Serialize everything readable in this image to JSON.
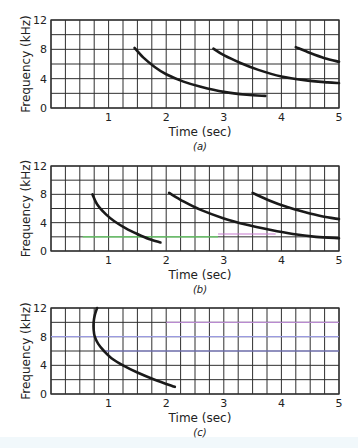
{
  "figure": {
    "panels": [
      "a",
      "b",
      "c"
    ],
    "grid_color": "#2f2f2f",
    "curve_color": "#1a1a1a",
    "background": "#ffffff"
  },
  "chart_data": [
    {
      "type": "line",
      "panel_label": "(a)",
      "xlabel": "Time (sec)",
      "ylabel": "Frequency (kHz)",
      "xlim": [
        0,
        5
      ],
      "ylim": [
        0,
        12
      ],
      "x_ticks": [
        "0",
        "1",
        "2",
        "3",
        "4",
        "5"
      ],
      "y_ticks": [
        "0",
        "4",
        "8",
        "12"
      ],
      "grid": {
        "x_step": 0.25,
        "y_step": 2
      },
      "tinted_gridlines": [],
      "series": [
        {
          "name": "glide 1",
          "points": [
            [
              1.45,
              8.2
            ],
            [
              1.6,
              6.9
            ],
            [
              1.8,
              5.6
            ],
            [
              2.0,
              4.6
            ],
            [
              2.3,
              3.6
            ],
            [
              2.6,
              2.9
            ],
            [
              3.0,
              2.2
            ],
            [
              3.4,
              1.8
            ],
            [
              3.72,
              1.65
            ]
          ]
        },
        {
          "name": "glide 2",
          "points": [
            [
              2.82,
              8.1
            ],
            [
              3.0,
              7.2
            ],
            [
              3.3,
              6.1
            ],
            [
              3.6,
              5.2
            ],
            [
              4.0,
              4.3
            ],
            [
              4.4,
              3.8
            ],
            [
              4.8,
              3.5
            ],
            [
              5.0,
              3.4
            ]
          ]
        },
        {
          "name": "glide 3",
          "points": [
            [
              4.25,
              8.3
            ],
            [
              4.5,
              7.5
            ],
            [
              4.75,
              6.8
            ],
            [
              5.0,
              6.3
            ]
          ]
        }
      ]
    },
    {
      "type": "line",
      "panel_label": "(b)",
      "xlabel": "Time (sec)",
      "ylabel": "Frequency (kHz)",
      "xlim": [
        0,
        5
      ],
      "ylim": [
        0,
        12
      ],
      "x_ticks": [
        "0",
        "1",
        "2",
        "3",
        "4",
        "5"
      ],
      "y_ticks": [
        "0",
        "4",
        "8",
        "12"
      ],
      "grid": {
        "x_step": 0.25,
        "y_step": 2
      },
      "tinted_gridlines": [
        {
          "y": 2,
          "x0": 0.55,
          "x1": 2.9,
          "color": "#6ad66a"
        },
        {
          "y": 2.4,
          "x0": 2.9,
          "x1": 3.9,
          "color": "#c77ad0"
        }
      ],
      "series": [
        {
          "name": "glide 1",
          "points": [
            [
              0.72,
              8.0
            ],
            [
              0.8,
              6.6
            ],
            [
              0.95,
              5.2
            ],
            [
              1.1,
              4.2
            ],
            [
              1.3,
              3.2
            ],
            [
              1.5,
              2.4
            ],
            [
              1.7,
              1.7
            ],
            [
              1.9,
              1.2
            ]
          ]
        },
        {
          "name": "glide 2",
          "points": [
            [
              2.05,
              8.2
            ],
            [
              2.3,
              7.0
            ],
            [
              2.6,
              5.8
            ],
            [
              3.0,
              4.6
            ],
            [
              3.4,
              3.7
            ],
            [
              3.8,
              3.0
            ],
            [
              4.2,
              2.4
            ],
            [
              4.6,
              2.0
            ],
            [
              5.0,
              1.8
            ]
          ]
        },
        {
          "name": "glide 3",
          "points": [
            [
              3.5,
              8.2
            ],
            [
              3.8,
              7.1
            ],
            [
              4.1,
              6.2
            ],
            [
              4.4,
              5.5
            ],
            [
              4.7,
              4.9
            ],
            [
              5.0,
              4.5
            ]
          ]
        }
      ]
    },
    {
      "type": "line",
      "panel_label": "(c)",
      "xlabel": "Time (sec)",
      "ylabel": "Frequency (kHz)",
      "xlim": [
        0,
        5
      ],
      "ylim": [
        0,
        12
      ],
      "x_ticks": [
        "0",
        "1",
        "2",
        "3",
        "4",
        "5"
      ],
      "y_ticks": [
        "0",
        "4",
        "8",
        "12"
      ],
      "grid": {
        "x_step": 0.25,
        "y_step": 2
      },
      "tinted_gridlines": [
        {
          "y": 10,
          "x0": 2.0,
          "x1": 5.0,
          "color": "#b98ad0"
        },
        {
          "y": 8,
          "x0": 0.0,
          "x1": 5.0,
          "color": "#9a9ae0"
        },
        {
          "y": 6,
          "x0": 0.9,
          "x1": 5.0,
          "color": "#8a8ae6"
        }
      ],
      "series": [
        {
          "name": "glide 1",
          "points": [
            [
              0.8,
              12.0
            ],
            [
              0.76,
              11.0
            ],
            [
              0.74,
              10.0
            ],
            [
              0.74,
              9.0
            ],
            [
              0.76,
              8.0
            ],
            [
              0.82,
              7.0
            ],
            [
              0.92,
              6.0
            ],
            [
              1.05,
              5.0
            ],
            [
              1.25,
              4.0
            ],
            [
              1.5,
              3.0
            ],
            [
              1.8,
              2.0
            ],
            [
              2.15,
              1.0
            ]
          ]
        }
      ]
    }
  ]
}
